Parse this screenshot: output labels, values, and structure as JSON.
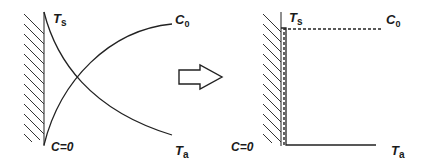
{
  "left_panel": {
    "labels": {
      "ts": {
        "main": "T",
        "sub": "s"
      },
      "c0": {
        "main": "C",
        "sub": "0"
      },
      "c_zero": "C=0",
      "ta": {
        "main": "T",
        "sub": "a"
      }
    },
    "curves": [
      "temperature-decay-Ts-to-Ta",
      "concentration-rise-0-to-C0"
    ]
  },
  "arrow": {
    "direction": "right",
    "style": "outlined"
  },
  "right_panel": {
    "labels": {
      "ts": {
        "main": "T",
        "sub": "s"
      },
      "c0": {
        "main": "C",
        "sub": "0"
      },
      "c_zero": "C=0",
      "ta": {
        "main": "T",
        "sub": "a"
      }
    },
    "profiles": [
      "step-temperature-solid",
      "step-concentration-dashed"
    ]
  },
  "colors": {
    "ink": "#222222",
    "background": "#ffffff"
  }
}
